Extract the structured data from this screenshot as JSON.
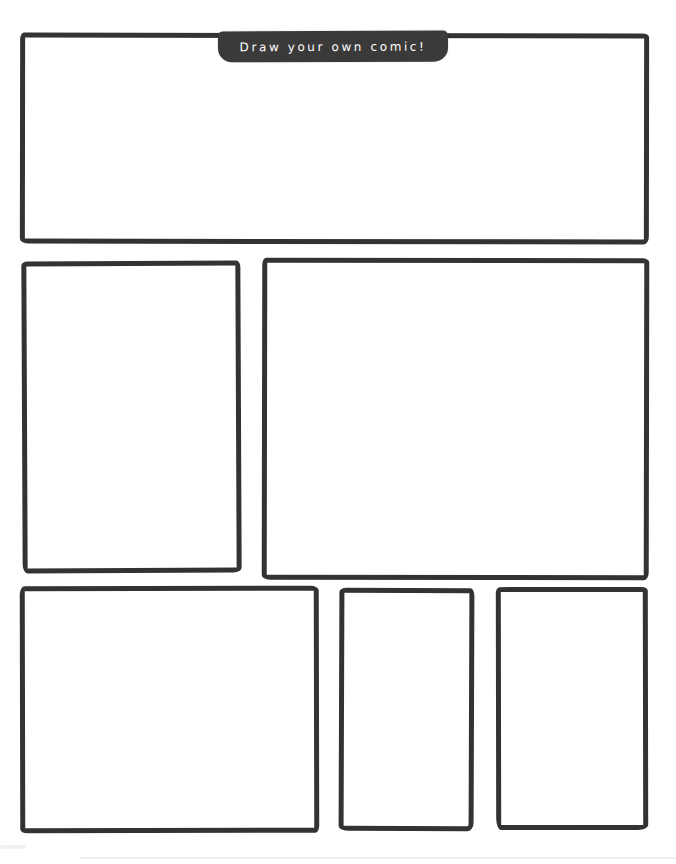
{
  "page": {
    "title_tab": {
      "label": "Draw your own comic!"
    },
    "colors": {
      "ink": "#333333",
      "tab_background": "#3a3a3a",
      "tab_text": "#ffffff",
      "paper": "#ffffff"
    },
    "panels": [
      {
        "id": "panel-1",
        "row": 1,
        "content": ""
      },
      {
        "id": "panel-2",
        "row": 2,
        "content": ""
      },
      {
        "id": "panel-3",
        "row": 2,
        "content": ""
      },
      {
        "id": "panel-4",
        "row": 3,
        "content": ""
      },
      {
        "id": "panel-5",
        "row": 3,
        "content": ""
      },
      {
        "id": "panel-6",
        "row": 3,
        "content": ""
      }
    ]
  }
}
